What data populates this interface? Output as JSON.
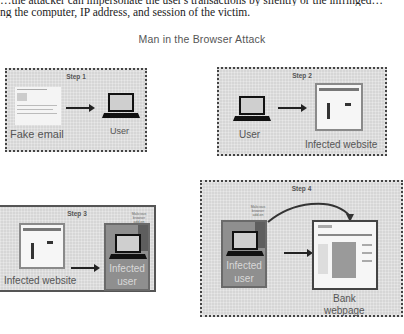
{
  "document": {
    "line1": "…the attacker can impersonate the user's transactions by silently or the infringed…",
    "line2": "ng the computer, IP address, and session of the victim."
  },
  "figure": {
    "title": "Man in the Browser Attack",
    "steps": [
      {
        "label": "Step 1",
        "left_item": "Fake email",
        "right_item": "User"
      },
      {
        "label": "Step 2",
        "left_item": "User",
        "right_item": "Infected website"
      },
      {
        "label": "Step 3",
        "left_item": "Infected website",
        "right_item_line1": "Infected",
        "right_item_line2": "user",
        "addon_note": "Malicious browser add-on"
      },
      {
        "label": "Step 4",
        "left_item_line1": "Infected",
        "left_item_line2": "user",
        "right_item_line1": "Bank",
        "right_item_line2": "webpage",
        "addon_note": "Malicious browser add-on"
      }
    ]
  }
}
